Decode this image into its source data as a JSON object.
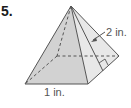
{
  "problem": {
    "number": "5.",
    "figure": "square-pyramid",
    "labels": {
      "slant_height": "2 in.",
      "base_edge": "1 in."
    }
  },
  "colors": {
    "face_left": "#d4d4d4",
    "face_right": "#e6e6e6",
    "edge": "#555555",
    "text": "#555555"
  }
}
